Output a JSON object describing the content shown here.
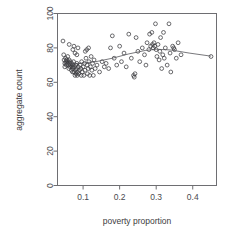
{
  "chart_data": {
    "type": "scatter",
    "title": "",
    "xlabel": "poverty proportion",
    "ylabel": "aggregate count",
    "xlim": [
      0.03,
      0.465
    ],
    "ylim": [
      0,
      100
    ],
    "grid": false,
    "legend": null,
    "marker": "open-circle",
    "xticks": [
      0.1,
      0.2,
      0.3,
      0.4
    ],
    "xtick_labels": [
      "0.1",
      "0.2",
      "0.3",
      "0.4"
    ],
    "yticks": [
      0,
      20,
      40,
      60,
      80,
      100
    ],
    "ytick_labels": [
      "0",
      "20",
      "40",
      "60",
      "80",
      "100"
    ],
    "points": [
      [
        0.045,
        84
      ],
      [
        0.047,
        76
      ],
      [
        0.048,
        73
      ],
      [
        0.05,
        71
      ],
      [
        0.05,
        69
      ],
      [
        0.052,
        74
      ],
      [
        0.053,
        72
      ],
      [
        0.054,
        70
      ],
      [
        0.055,
        73
      ],
      [
        0.056,
        71
      ],
      [
        0.058,
        75
      ],
      [
        0.059,
        72
      ],
      [
        0.06,
        70
      ],
      [
        0.061,
        68
      ],
      [
        0.062,
        73
      ],
      [
        0.063,
        71
      ],
      [
        0.064,
        69
      ],
      [
        0.065,
        72
      ],
      [
        0.066,
        70
      ],
      [
        0.068,
        67
      ],
      [
        0.069,
        71
      ],
      [
        0.07,
        69
      ],
      [
        0.071,
        66
      ],
      [
        0.072,
        70
      ],
      [
        0.073,
        68
      ],
      [
        0.074,
        72
      ],
      [
        0.075,
        66
      ],
      [
        0.076,
        69
      ],
      [
        0.078,
        64
      ],
      [
        0.079,
        67
      ],
      [
        0.08,
        70
      ],
      [
        0.081,
        65
      ],
      [
        0.082,
        68
      ],
      [
        0.083,
        71
      ],
      [
        0.084,
        64
      ],
      [
        0.085,
        66
      ],
      [
        0.086,
        80
      ],
      [
        0.087,
        69
      ],
      [
        0.088,
        65
      ],
      [
        0.09,
        67
      ],
      [
        0.062,
        82
      ],
      [
        0.072,
        79
      ],
      [
        0.075,
        81
      ],
      [
        0.078,
        77
      ],
      [
        0.083,
        76
      ],
      [
        0.092,
        70
      ],
      [
        0.094,
        68
      ],
      [
        0.095,
        64
      ],
      [
        0.096,
        72
      ],
      [
        0.098,
        66
      ],
      [
        0.1,
        69
      ],
      [
        0.102,
        64
      ],
      [
        0.104,
        71
      ],
      [
        0.105,
        67
      ],
      [
        0.106,
        78
      ],
      [
        0.108,
        74
      ],
      [
        0.11,
        79
      ],
      [
        0.111,
        70
      ],
      [
        0.112,
        65
      ],
      [
        0.114,
        68
      ],
      [
        0.115,
        80
      ],
      [
        0.116,
        72
      ],
      [
        0.118,
        64
      ],
      [
        0.12,
        69
      ],
      [
        0.122,
        75
      ],
      [
        0.124,
        67
      ],
      [
        0.126,
        71
      ],
      [
        0.128,
        64
      ],
      [
        0.13,
        73
      ],
      [
        0.133,
        68
      ],
      [
        0.138,
        70
      ],
      [
        0.145,
        66
      ],
      [
        0.152,
        72
      ],
      [
        0.158,
        69
      ],
      [
        0.163,
        71
      ],
      [
        0.17,
        68
      ],
      [
        0.175,
        80
      ],
      [
        0.18,
        87
      ],
      [
        0.185,
        74
      ],
      [
        0.192,
        70
      ],
      [
        0.2,
        81
      ],
      [
        0.205,
        72
      ],
      [
        0.212,
        77
      ],
      [
        0.218,
        69
      ],
      [
        0.225,
        88
      ],
      [
        0.232,
        74
      ],
      [
        0.238,
        64
      ],
      [
        0.24,
        63
      ],
      [
        0.242,
        65
      ],
      [
        0.245,
        86
      ],
      [
        0.25,
        78
      ],
      [
        0.255,
        72
      ],
      [
        0.262,
        80
      ],
      [
        0.268,
        76
      ],
      [
        0.272,
        70
      ],
      [
        0.275,
        83
      ],
      [
        0.28,
        79
      ],
      [
        0.282,
        88
      ],
      [
        0.285,
        81
      ],
      [
        0.288,
        89
      ],
      [
        0.29,
        82
      ],
      [
        0.292,
        80
      ],
      [
        0.294,
        83
      ],
      [
        0.296,
        81
      ],
      [
        0.298,
        94
      ],
      [
        0.3,
        79
      ],
      [
        0.302,
        75
      ],
      [
        0.305,
        82
      ],
      [
        0.308,
        73
      ],
      [
        0.31,
        78
      ],
      [
        0.312,
        86
      ],
      [
        0.315,
        68
      ],
      [
        0.318,
        76
      ],
      [
        0.32,
        89
      ],
      [
        0.322,
        74
      ],
      [
        0.325,
        80
      ],
      [
        0.33,
        70
      ],
      [
        0.335,
        94
      ],
      [
        0.338,
        77
      ],
      [
        0.34,
        66
      ],
      [
        0.345,
        81
      ],
      [
        0.348,
        80
      ],
      [
        0.35,
        79
      ],
      [
        0.355,
        74
      ],
      [
        0.36,
        83
      ],
      [
        0.368,
        76
      ],
      [
        0.45,
        75
      ]
    ],
    "trend_line": {
      "label": "loess-smooth",
      "x": [
        0.045,
        0.09,
        0.135,
        0.18,
        0.225,
        0.27,
        0.3,
        0.34,
        0.39,
        0.45
      ],
      "y": [
        70.5,
        71.0,
        72.0,
        74.0,
        76.5,
        78.5,
        79.2,
        78.8,
        77.0,
        75.2
      ]
    }
  }
}
